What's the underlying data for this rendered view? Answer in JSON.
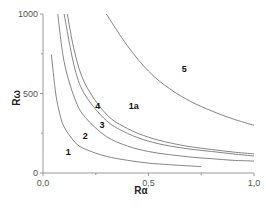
{
  "chart_data": {
    "type": "line",
    "title": "",
    "xlabel": "Rα",
    "ylabel": "Rω",
    "xlim": [
      0.0,
      1.0
    ],
    "ylim": [
      0,
      1000
    ],
    "xticks": [
      {
        "value": 0.0,
        "label": "0,0"
      },
      {
        "value": 0.5,
        "label": "0,5"
      },
      {
        "value": 1.0,
        "label": "1,0"
      }
    ],
    "yticks": [
      {
        "value": 0,
        "label": "0"
      },
      {
        "value": 500,
        "label": "500"
      },
      {
        "value": 1000,
        "label": "1000"
      }
    ],
    "grid": false,
    "legend": "none (curves labeled inline)",
    "region_labels": [
      {
        "text": "1",
        "x": 0.12,
        "y": 130
      },
      {
        "text": "2",
        "x": 0.2,
        "y": 235
      },
      {
        "text": "3",
        "x": 0.28,
        "y": 305
      },
      {
        "text": "4",
        "x": 0.26,
        "y": 420
      },
      {
        "text": "1a",
        "x": 0.43,
        "y": 420
      },
      {
        "text": "5",
        "x": 0.67,
        "y": 655
      }
    ],
    "series": [
      {
        "name": "boundary-1",
        "x": [
          0.04,
          0.06,
          0.08,
          0.1,
          0.15,
          0.2,
          0.3,
          0.4,
          0.5,
          0.6,
          0.75
        ],
        "y": [
          745,
          500,
          370,
          290,
          195,
          150,
          105,
          80,
          62,
          52,
          40
        ]
      },
      {
        "name": "boundary-2",
        "x": [
          0.07,
          0.1,
          0.15,
          0.2,
          0.3,
          0.4,
          0.5,
          0.6,
          0.7,
          0.8,
          0.9,
          1.0
        ],
        "y": [
          1000,
          700,
          470,
          350,
          230,
          170,
          135,
          115,
          100,
          90,
          80,
          75
        ]
      },
      {
        "name": "boundary-3",
        "x": [
          0.1,
          0.15,
          0.2,
          0.3,
          0.4,
          0.5,
          0.6,
          0.7,
          0.8,
          0.9,
          1.0
        ],
        "y": [
          1000,
          660,
          490,
          330,
          250,
          200,
          170,
          150,
          135,
          120,
          107
        ]
      },
      {
        "name": "boundary-4",
        "x": [
          0.115,
          0.15,
          0.2,
          0.3,
          0.4,
          0.5,
          0.6,
          0.7,
          0.8,
          0.9,
          1.0
        ],
        "y": [
          1000,
          760,
          560,
          370,
          280,
          225,
          190,
          165,
          148,
          132,
          120
        ]
      },
      {
        "name": "boundary-5",
        "x": [
          0.3,
          0.4,
          0.5,
          0.6,
          0.7,
          0.8,
          0.9,
          1.0
        ],
        "y": [
          1000,
          800,
          640,
          530,
          450,
          390,
          340,
          300
        ]
      }
    ]
  },
  "axes": {
    "x_label": "Rα",
    "y_label": "Rω"
  }
}
